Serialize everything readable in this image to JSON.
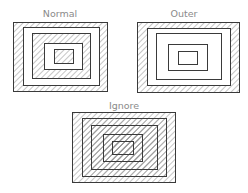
{
  "colors": {
    "line": "#3a3a3a",
    "hatch": "#8c8c8c",
    "label": "#8a8a8a",
    "background": "#ffffff"
  },
  "panels": [
    {
      "name": "normal",
      "label": "Normal",
      "label_pos": [
        60,
        17
      ],
      "style": "alternate",
      "rects": [
        [
          13,
          22,
          94,
          69
        ],
        [
          23,
          27,
          76,
          58
        ],
        [
          32,
          33,
          58,
          45
        ],
        [
          44,
          43,
          38,
          26
        ],
        [
          54,
          49,
          19,
          14
        ]
      ]
    },
    {
      "name": "outer",
      "label": "Outer",
      "label_pos": [
        184,
        17
      ],
      "style": "outer",
      "rects": [
        [
          137,
          22,
          102,
          70
        ],
        [
          147,
          28,
          83,
          57
        ],
        [
          156,
          33,
          65,
          46
        ],
        [
          168,
          44,
          39,
          26
        ],
        [
          178,
          51,
          19,
          13
        ]
      ]
    },
    {
      "name": "ignore",
      "label": "Ignore",
      "label_pos": [
        124,
        109
      ],
      "style": "ignore",
      "rects": [
        [
          72,
          112,
          103,
          70
        ],
        [
          82,
          118,
          84,
          58
        ],
        [
          91,
          125,
          66,
          44
        ],
        [
          103,
          134,
          39,
          27
        ],
        [
          112,
          141,
          21,
          13
        ]
      ]
    }
  ]
}
